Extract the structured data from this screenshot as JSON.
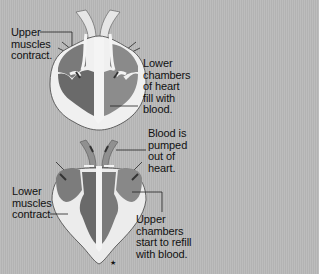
{
  "diagram": {
    "panels": [
      {
        "name": "atria-contract",
        "labels": [
          {
            "id": "upper-muscles",
            "text": "Upper\nmuscles\ncontract."
          },
          {
            "id": "lower-chambers-fill",
            "text": "Lower\nchambers\nof heart\nfill with\nblood."
          }
        ]
      },
      {
        "name": "ventricles-contract",
        "labels": [
          {
            "id": "blood-pumped",
            "text": "Blood is\npumped\nout of\nheart."
          },
          {
            "id": "lower-muscles",
            "text": "Lower\nmuscles\ncontract."
          },
          {
            "id": "upper-chambers-refill",
            "text": "Upper\nchambers\nstart to refill\nwith blood."
          }
        ]
      }
    ],
    "footnote_symbol": "★"
  },
  "colors": {
    "background": "#b8b8b8",
    "heart_wall": "#f2f2f2",
    "chamber_dark": "#6e6e6e",
    "chamber_mid": "#8c8c8c",
    "vessel": "#e8e8e8",
    "text": "#111111"
  }
}
